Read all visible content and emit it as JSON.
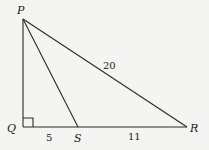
{
  "diagram": {
    "type": "right triangle",
    "points": {
      "P": {
        "label": "P",
        "x": 23,
        "y": 19
      },
      "Q": {
        "label": "Q",
        "x": 23,
        "y": 127
      },
      "S": {
        "label": "S",
        "x": 78,
        "y": 127
      },
      "R": {
        "label": "R",
        "x": 187,
        "y": 127
      }
    },
    "segments": [
      {
        "from": "P",
        "to": "Q"
      },
      {
        "from": "Q",
        "to": "R"
      },
      {
        "from": "P",
        "to": "R",
        "length_label": "20"
      },
      {
        "from": "P",
        "to": "S"
      }
    ],
    "length_labels": {
      "PR": "20",
      "QS": "5",
      "SR": "11"
    },
    "right_angle_at": "Q",
    "colors": {
      "stroke": "#2a2a2a",
      "background": "#f4f4f2"
    }
  }
}
